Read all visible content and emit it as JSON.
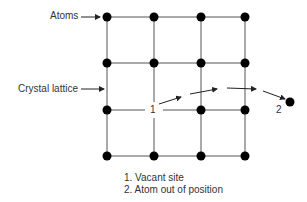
{
  "diagram": {
    "labels": {
      "atoms": "Atoms",
      "crystal_lattice": "Crystal lattice",
      "marker_1": "1",
      "marker_2": "2"
    },
    "legend": [
      "1. Vacant site",
      "2. Atom out of position"
    ],
    "grid": {
      "columns_x": [
        107,
        154,
        201,
        245
      ],
      "rows_y": [
        17,
        63,
        110,
        156
      ],
      "vacancy": {
        "col": 1,
        "row": 2
      },
      "displaced_atom": {
        "x": 290,
        "y": 102
      }
    },
    "colors": {
      "atom": "#000000",
      "line": "#555555"
    }
  }
}
